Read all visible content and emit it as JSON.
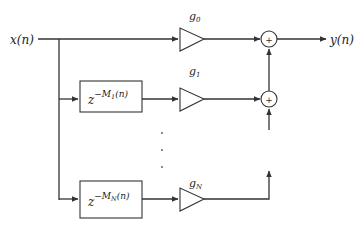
{
  "diagram": {
    "input_label": "x(n)",
    "output_label": "y(n)",
    "gains": [
      {
        "label_base": "g",
        "label_sub": "0"
      },
      {
        "label_base": "g",
        "label_sub": "1"
      },
      {
        "label_base": "g",
        "label_sub": "N"
      }
    ],
    "delays": [
      {
        "base": "z",
        "exp_prefix": "−M",
        "exp_sub": "1",
        "exp_suffix": "(n)"
      },
      {
        "base": "z",
        "exp_prefix": "−M",
        "exp_sub": "N",
        "exp_suffix": "(n)"
      }
    ],
    "summer_symbol": "+",
    "ellipsis": "⋮"
  }
}
